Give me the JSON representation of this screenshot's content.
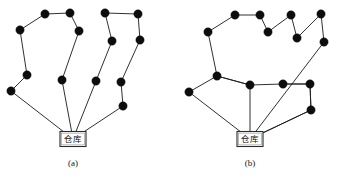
{
  "figure": {
    "title": "",
    "background_color": "#ffffff",
    "node_color": "#0d0d0d",
    "edge_color": "#1a1a1a",
    "depot_label": "仓库",
    "node_radius": 4.2,
    "depot_box": {
      "width": 26,
      "height": 15
    }
  },
  "panels": [
    {
      "id": "panel-a",
      "caption": "(a)",
      "caption_x": 73,
      "caption_y": 166,
      "depot": {
        "x": 73,
        "y": 139
      },
      "nodes": [
        {
          "id": "a1",
          "x": 20,
          "y": 30
        },
        {
          "id": "a2",
          "x": 45,
          "y": 14
        },
        {
          "id": "a3",
          "x": 70,
          "y": 13
        },
        {
          "id": "a4",
          "x": 79,
          "y": 31
        },
        {
          "id": "a5",
          "x": 62,
          "y": 80
        },
        {
          "id": "a6",
          "x": 27,
          "y": 75
        },
        {
          "id": "a7",
          "x": 11,
          "y": 91
        },
        {
          "id": "a8",
          "x": 105,
          "y": 13
        },
        {
          "id": "a9",
          "x": 112,
          "y": 41
        },
        {
          "id": "a10",
          "x": 96,
          "y": 81
        },
        {
          "id": "a11",
          "x": 138,
          "y": 14
        },
        {
          "id": "a12",
          "x": 140,
          "y": 40
        },
        {
          "id": "a13",
          "x": 121,
          "y": 82
        },
        {
          "id": "a14",
          "x": 123,
          "y": 106
        }
      ],
      "routes": [
        {
          "id": "a-route-1",
          "sequence": [
            "depot",
            "a5",
            "a4",
            "a3",
            "a2",
            "a1",
            "a6",
            "a7",
            "depot"
          ]
        },
        {
          "id": "a-route-2",
          "sequence": [
            "depot",
            "a10",
            "a9",
            "a8",
            "a11",
            "a12",
            "a13",
            "a14",
            "depot"
          ]
        }
      ]
    },
    {
      "id": "panel-b",
      "caption": "(b)",
      "caption_x": 250,
      "caption_y": 166,
      "depot": {
        "x": 250,
        "y": 139
      },
      "nodes": [
        {
          "id": "b1",
          "x": 208,
          "y": 32
        },
        {
          "id": "b2",
          "x": 235,
          "y": 15
        },
        {
          "id": "b3",
          "x": 260,
          "y": 15
        },
        {
          "id": "b4",
          "x": 268,
          "y": 32
        },
        {
          "id": "b5",
          "x": 291,
          "y": 15
        },
        {
          "id": "b6",
          "x": 297,
          "y": 38
        },
        {
          "id": "b7",
          "x": 321,
          "y": 14
        },
        {
          "id": "b8",
          "x": 324,
          "y": 42
        },
        {
          "id": "b9",
          "x": 217,
          "y": 76
        },
        {
          "id": "b10",
          "x": 189,
          "y": 92
        },
        {
          "id": "b11",
          "x": 250,
          "y": 85
        },
        {
          "id": "b12",
          "x": 283,
          "y": 84
        },
        {
          "id": "b13",
          "x": 310,
          "y": 84
        },
        {
          "id": "b14",
          "x": 311,
          "y": 110
        }
      ],
      "routes": [
        {
          "id": "b-route-1",
          "sequence": [
            "depot",
            "b11",
            "b9",
            "b1",
            "b2",
            "b3",
            "b4",
            "b5",
            "b6",
            "b7",
            "b8",
            "depot"
          ]
        },
        {
          "id": "b-route-2",
          "sequence": [
            "depot",
            "b10",
            "b9",
            "b11",
            "b12",
            "b13",
            "b14",
            "depot"
          ]
        }
      ],
      "extra_edges": [
        {
          "from": "b12",
          "to": "b13"
        },
        {
          "from": "b13",
          "to": "b14"
        },
        {
          "from": "b14",
          "to": "depot"
        }
      ]
    }
  ]
}
